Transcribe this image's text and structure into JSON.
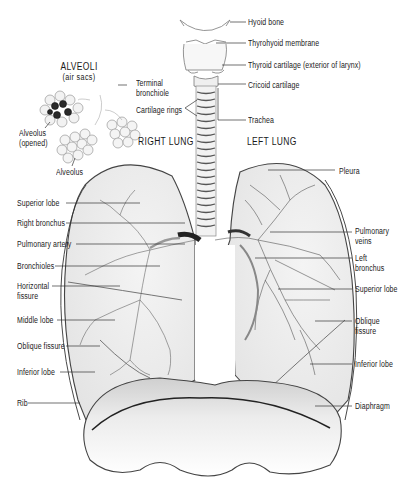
{
  "figure": {
    "type": "anatomical-diagram"
  },
  "headings": {
    "alveoli_title": "ALVEOLI",
    "alveoli_subtitle": "(air sacs)",
    "right_lung": "RIGHT LUNG",
    "left_lung": "LEFT LUNG"
  },
  "labels": {
    "hyoid_bone": "Hyoid bone",
    "thyrohyoid_membrane": "Thyrohyoid membrane",
    "thyroid_cartilage": "Thyroid cartilage (exterior of larynx)",
    "cricoid_cartilage": "Cricoid cartilage",
    "terminal_bronchiole_1": "Terminal",
    "terminal_bronchiole_2": "bronchiole",
    "cartilage_rings": "Cartilage rings",
    "trachea": "Trachea",
    "alveolus_opened_1": "Alveolus",
    "alveolus_opened_2": "(opened)",
    "alveolus": "Alveolus",
    "pleura": "Pleura",
    "right_superior_lobe": "Superior lobe",
    "right_bronchus": "Right bronchus",
    "pulmonary_artery": "Pulmonary artery",
    "bronchioles": "Bronchioles",
    "horizontal_fissure_1": "Horizontal",
    "horizontal_fissure_2": "fissure",
    "middle_lobe": "Middle lobe",
    "right_oblique_fissure": "Oblique fissure",
    "right_inferior_lobe": "Inferior lobe",
    "rib": "Rib",
    "pulmonary_veins_1": "Pulmonary",
    "pulmonary_veins_2": "veins",
    "left_bronchus_1": "Left",
    "left_bronchus_2": "bronchus",
    "left_superior_lobe": "Superior lobe",
    "left_oblique_fissure_1": "Oblique",
    "left_oblique_fissure_2": "fissure",
    "left_inferior_lobe": "Inferior lobe",
    "diaphragm": "Diaphragm"
  },
  "colors": {
    "ink": "#1a1a1a",
    "line": "#333333",
    "shade": "#bdbdbd",
    "alveolus_dark": "#2a2a2a",
    "background": "#ffffff"
  }
}
